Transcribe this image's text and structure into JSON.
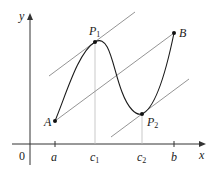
{
  "diagram": {
    "axes": {
      "x_label": "x",
      "y_label": "y",
      "origin_label": "0"
    },
    "points": {
      "A": {
        "label": "A"
      },
      "B": {
        "label": "B"
      },
      "P1": {
        "label": "P",
        "sub": "1"
      },
      "P2": {
        "label": "P",
        "sub": "2"
      }
    },
    "x_ticks": [
      {
        "label": "a",
        "sub": ""
      },
      {
        "label": "c",
        "sub": "1"
      },
      {
        "label": "c",
        "sub": "2"
      },
      {
        "label": "b",
        "sub": ""
      }
    ],
    "colors": {
      "curve": "#1a1a1a",
      "axis": "#333333",
      "secant": "#888888",
      "guide": "#bbbbbb"
    }
  }
}
